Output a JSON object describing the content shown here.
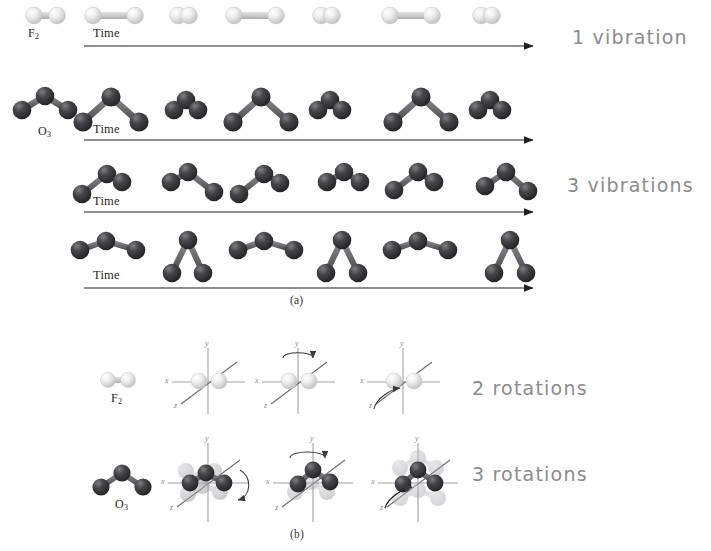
{
  "figure": {
    "title_caption_a": "(a)",
    "title_caption_b": "(b)",
    "background_color": "#ffffff"
  },
  "colors": {
    "fluorine_atom": "#e9e9ea",
    "fluorine_atom_shadow": "#bdbdbe",
    "oxygen_atom": "#3a3a3c",
    "oxygen_atom_highlight": "#6e6e72",
    "bond_light": "#c9c9cb",
    "bond_dark": "#6f6f73",
    "axis_line": "#9c9a9d",
    "arrow_line": "#231f20",
    "time_rule": "#6f6d70",
    "handwriting": "#8b8b8d",
    "ghost_atom": "#cfcfd2"
  },
  "panel_a": {
    "caption": "(a)",
    "rows": [
      {
        "molecule_label": "F",
        "molecule_sub": "2",
        "axis_label": "Time",
        "annotation": "1  vibration",
        "mode": "symmetric-stretch",
        "frames": 6
      },
      {
        "molecule_label": "O",
        "molecule_sub": "3",
        "axis_label": "Time",
        "annotation": "",
        "mode": "symmetric-stretch",
        "frames": 6
      },
      {
        "molecule_label": "",
        "molecule_sub": "",
        "axis_label": "Time",
        "annotation": "3  vibrations",
        "mode": "asymmetric-stretch",
        "frames": 6
      },
      {
        "molecule_label": "",
        "molecule_sub": "",
        "axis_label": "Time",
        "annotation": "",
        "mode": "bend",
        "frames": 6
      }
    ]
  },
  "panel_b": {
    "caption": "(b)",
    "rows": [
      {
        "molecule_label": "F",
        "molecule_sub": "2",
        "annotation": "2  rotations",
        "axes": [
          "x",
          "y",
          "z"
        ],
        "panels": [
          {
            "rotation_axis": "none",
            "has_arrow": false
          },
          {
            "rotation_axis": "y",
            "has_arrow": true
          },
          {
            "rotation_axis": "z",
            "has_arrow": true
          }
        ]
      },
      {
        "molecule_label": "O",
        "molecule_sub": "3",
        "annotation": "3  rotations",
        "axes": [
          "x",
          "y",
          "z"
        ],
        "panels": [
          {
            "rotation_axis": "x",
            "has_arrow": true
          },
          {
            "rotation_axis": "y",
            "has_arrow": true
          },
          {
            "rotation_axis": "z",
            "has_arrow": true
          }
        ]
      }
    ]
  },
  "annotations": {
    "vibration_1": "1  vibration",
    "vibrations_3": "3  vibrations",
    "rotations_2": "2  rotations",
    "rotations_3": "3  rotations"
  },
  "axis_labels": {
    "x": "x",
    "y": "y",
    "z": "z",
    "time": "Time"
  },
  "molecules": {
    "f2": {
      "formula": "F",
      "subscript": "2"
    },
    "o3": {
      "formula": "O",
      "subscript": "3"
    }
  }
}
